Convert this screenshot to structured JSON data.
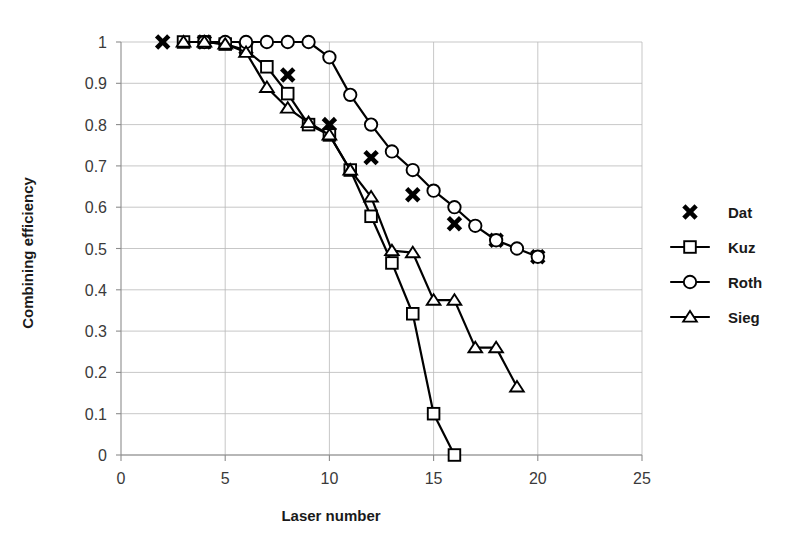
{
  "chart_data": {
    "type": "line",
    "title": "",
    "xlabel": "Laser number",
    "ylabel": "Combining efficiency",
    "xlim": [
      0,
      25
    ],
    "ylim": [
      0,
      1
    ],
    "xticks": [
      0,
      5,
      10,
      15,
      20,
      25
    ],
    "yticks": [
      0,
      0.1,
      0.2,
      0.3,
      0.4,
      0.5,
      0.6,
      0.7,
      0.8,
      0.9,
      1
    ],
    "xtick_labels": [
      "0",
      "5",
      "10",
      "15",
      "20",
      "25"
    ],
    "ytick_labels": [
      "0",
      "0.1",
      "0.2",
      "0.3",
      "0.4",
      "0.5",
      "0.6",
      "0.7",
      "0.8",
      "0.9",
      "1"
    ],
    "grid": true,
    "grid_axis": "both",
    "legend_position": "right",
    "series": [
      {
        "name": "Dat",
        "marker": "x",
        "line": false,
        "x": [
          2,
          4,
          6,
          8,
          10,
          12,
          14,
          16,
          18,
          20
        ],
        "y": [
          1.0,
          1.0,
          0.985,
          0.92,
          0.8,
          0.72,
          0.63,
          0.56,
          0.52,
          0.48
        ]
      },
      {
        "name": "Kuz",
        "marker": "square",
        "line": true,
        "x": [
          3,
          4,
          5,
          6,
          7,
          8,
          9,
          10,
          11,
          12,
          13,
          14,
          15,
          16
        ],
        "y": [
          1.0,
          1.0,
          0.995,
          0.98,
          0.94,
          0.875,
          0.8,
          0.775,
          0.69,
          0.578,
          0.465,
          0.342,
          0.1,
          0.0
        ]
      },
      {
        "name": "Roth",
        "marker": "circle",
        "line": true,
        "x": [
          4,
          5,
          6,
          7,
          8,
          9,
          10,
          11,
          12,
          13,
          14,
          15,
          16,
          17,
          18,
          19,
          20
        ],
        "y": [
          1.0,
          1.0,
          1.0,
          1.0,
          1.0,
          1.0,
          0.963,
          0.872,
          0.8,
          0.735,
          0.69,
          0.64,
          0.6,
          0.555,
          0.52,
          0.5,
          0.48
        ]
      },
      {
        "name": "Sieg",
        "marker": "triangle",
        "line": true,
        "x": [
          3,
          4,
          5,
          6,
          7,
          8,
          9,
          10,
          11,
          12,
          13,
          14,
          15,
          16,
          17,
          18,
          19
        ],
        "y": [
          1.0,
          1.0,
          0.995,
          0.975,
          0.89,
          0.84,
          0.805,
          0.775,
          0.69,
          0.625,
          0.495,
          0.49,
          0.375,
          0.375,
          0.26,
          0.26,
          0.165
        ]
      }
    ],
    "legend_entries": [
      {
        "label": "Dat",
        "marker": "x",
        "line": false
      },
      {
        "label": "Kuz",
        "marker": "square",
        "line": true
      },
      {
        "label": "Roth",
        "marker": "circle",
        "line": true
      },
      {
        "label": "Sieg",
        "marker": "triangle",
        "line": true
      }
    ],
    "colors": {
      "series": "#000000",
      "grid": "#b9b9b9",
      "axis": "#8c8c8c",
      "text": "#1a1a1a",
      "background": "#ffffff"
    }
  }
}
